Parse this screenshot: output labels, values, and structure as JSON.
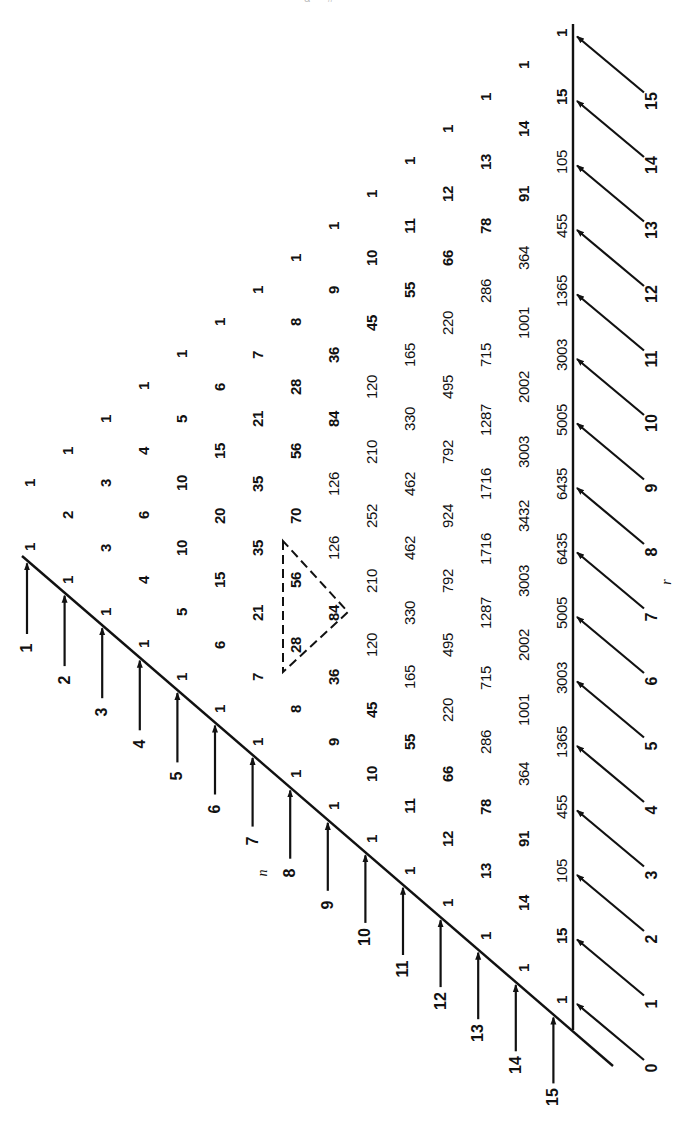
{
  "diagram": {
    "header_fragment": "— α —  #",
    "axis_labels": {
      "n": "n",
      "r": "r"
    },
    "row_labels": [
      "1",
      "2",
      "3",
      "4",
      "5",
      "6",
      "7",
      "8",
      "9",
      "10",
      "11",
      "12",
      "13",
      "14",
      "15"
    ],
    "column_labels": [
      "0",
      "1",
      "2",
      "3",
      "4",
      "5",
      "6",
      "7",
      "8",
      "9",
      "10",
      "11",
      "12",
      "13",
      "14",
      "15"
    ],
    "rows": [
      [
        "1",
        "1"
      ],
      [
        "1",
        "2",
        "1"
      ],
      [
        "1",
        "3",
        "3",
        "1"
      ],
      [
        "1",
        "4",
        "6",
        "4",
        "1"
      ],
      [
        "1",
        "5",
        "10",
        "10",
        "5",
        "1"
      ],
      [
        "1",
        "6",
        "15",
        "20",
        "15",
        "6",
        "1"
      ],
      [
        "1",
        "7",
        "21",
        "35",
        "35",
        "21",
        "7",
        "1"
      ],
      [
        "1",
        "8",
        "28",
        "56",
        "70",
        "56",
        "28",
        "8",
        "1"
      ],
      [
        "1",
        "9",
        "36",
        "84",
        "126",
        "126",
        "84",
        "36",
        "9",
        "1"
      ],
      [
        "1",
        "10",
        "45",
        "120",
        "210",
        "252",
        "210",
        "120",
        "45",
        "10",
        "1"
      ],
      [
        "1",
        "11",
        "55",
        "165",
        "330",
        "462",
        "462",
        "330",
        "165",
        "55",
        "11",
        "1"
      ],
      [
        "1",
        "12",
        "66",
        "220",
        "495",
        "792",
        "924",
        "792",
        "495",
        "220",
        "66",
        "12",
        "1"
      ],
      [
        "1",
        "13",
        "78",
        "286",
        "715",
        "1287",
        "1716",
        "1716",
        "1287",
        "715",
        "286",
        "78",
        "13",
        "1"
      ],
      [
        "1",
        "14",
        "91",
        "364",
        "1001",
        "2002",
        "3003",
        "3432",
        "3003",
        "2002",
        "1001",
        "364",
        "91",
        "14",
        "1"
      ],
      [
        "1",
        "15",
        "105",
        "455",
        "1365",
        "3003",
        "5005",
        "6435",
        "6435",
        "5005",
        "3003",
        "1365",
        "455",
        "105",
        "15",
        "1"
      ]
    ],
    "highlight": {
      "description": "dashed triangle showing 28 + 56 = 84",
      "values": [
        "28",
        "56",
        "84"
      ]
    },
    "colors": {
      "ink": "#111111",
      "background": "#ffffff"
    }
  }
}
